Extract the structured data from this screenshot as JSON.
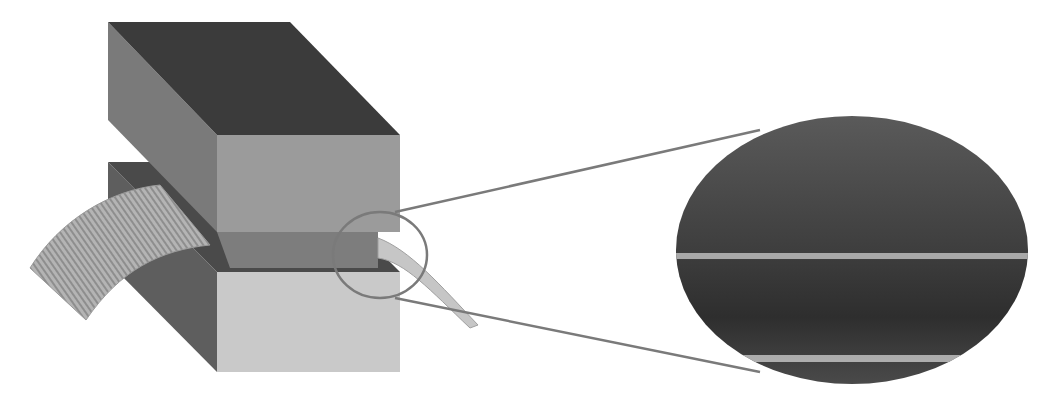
{
  "figure": {
    "colors": {
      "background": "#ffffff",
      "top_block_top": "#3a3a3a",
      "top_block_side": "#7a7a7a",
      "top_block_front": "#9a9a9a",
      "bottom_block_front": "#c8c8c8",
      "bottom_block_side": "#5e5e5e",
      "gap_plate": "#7d7d7d",
      "ribbon": "#a8a8a8",
      "callout_line": "#777777",
      "magnified_bg": "#4a4a4a",
      "magnified_line": "#b0b0b0"
    }
  }
}
